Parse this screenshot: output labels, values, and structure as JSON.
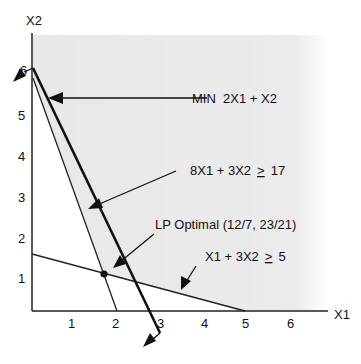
{
  "diagram": {
    "axes": {
      "x_label": "X1",
      "y_label": "X2",
      "x_ticks": [
        "1",
        "2",
        "3",
        "4",
        "5",
        "6"
      ],
      "y_ticks": [
        "1",
        "2",
        "3",
        "4",
        "5",
        "6"
      ]
    },
    "annotations": {
      "objective": "MIN  2X1 + X2",
      "constraint1": "8X1 + 3X2 ≥ 17",
      "constraint1_lhs": "8X1 + 3X2",
      "constraint1_rhs": "17",
      "optimal": "LP Optimal (12/7, 23/21)",
      "constraint2": "X1 + 3X2 ≥ 5",
      "constraint2_lhs": "X1 + 3X2",
      "constraint2_rhs": "5",
      "geq_symbol": "≥"
    },
    "optimal_point": {
      "x1": "12/7",
      "x2": "23/21"
    },
    "colors": {
      "line": "#111111",
      "feasible_shade": "#e9e9e9",
      "background": "#ffffff"
    }
  }
}
